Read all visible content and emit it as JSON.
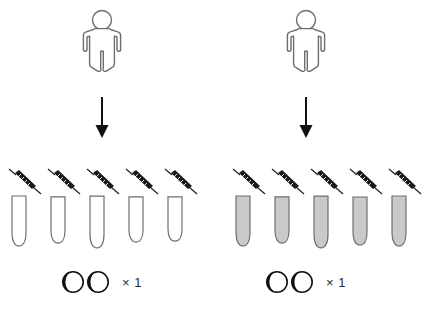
{
  "diagram": {
    "title": "",
    "colors": {
      "outline": "#6e6e6e",
      "arrow": "#111111",
      "pipette_body": "#1a1a1a",
      "tube_fill_empty": "#ffffff",
      "tube_fill_gray": "#c9c9c9",
      "marker_dark": "#111111",
      "marker_light": "#ffffff",
      "text": "#2b2b2b",
      "background": "#ffffff"
    },
    "groups": [
      {
        "id": "group-left",
        "person": {
          "icon": "person-icon",
          "label": "",
          "fill": "#ffffff",
          "stroke": "#6e6e6e"
        },
        "arrow": {
          "icon": "arrow-down-icon",
          "label": ""
        },
        "samples": {
          "count": 5,
          "pipette_icon": "pipette-icon",
          "tube_icon": "test-tube-icon",
          "tube_fill": "empty",
          "tube_fill_color": "#ffffff",
          "items": [
            {
              "index": 1,
              "tube_fill": "empty"
            },
            {
              "index": 2,
              "tube_fill": "empty"
            },
            {
              "index": 3,
              "tube_fill": "empty"
            },
            {
              "index": 4,
              "tube_fill": "empty"
            },
            {
              "index": 5,
              "tube_fill": "empty"
            }
          ]
        },
        "marker": {
          "icon": "eye-pair-icon",
          "circle_count": 2,
          "multiplier": "× 1"
        }
      },
      {
        "id": "group-right",
        "person": {
          "icon": "person-icon",
          "label": "",
          "fill": "#ffffff",
          "stroke": "#6e6e6e"
        },
        "arrow": {
          "icon": "arrow-down-icon",
          "label": ""
        },
        "samples": {
          "count": 5,
          "pipette_icon": "pipette-icon",
          "tube_icon": "test-tube-icon",
          "tube_fill": "gray",
          "tube_fill_color": "#c9c9c9",
          "items": [
            {
              "index": 1,
              "tube_fill": "gray"
            },
            {
              "index": 2,
              "tube_fill": "gray"
            },
            {
              "index": 3,
              "tube_fill": "gray"
            },
            {
              "index": 4,
              "tube_fill": "gray"
            },
            {
              "index": 5,
              "tube_fill": "gray"
            }
          ]
        },
        "marker": {
          "icon": "eye-pair-icon",
          "circle_count": 2,
          "multiplier": "× 1"
        }
      }
    ]
  }
}
